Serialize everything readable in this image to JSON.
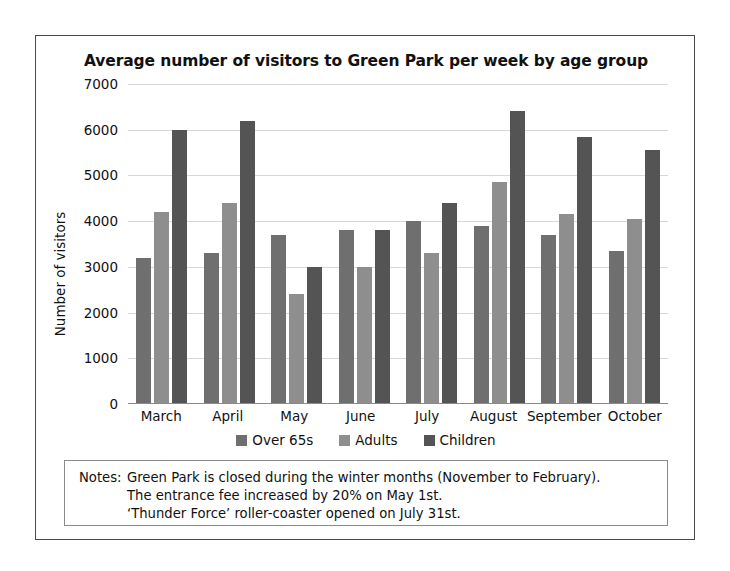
{
  "chart_data": {
    "type": "bar",
    "title": "Average number of visitors to Green Park per week by age group",
    "xlabel": "",
    "ylabel": "Number of visitors",
    "categories": [
      "March",
      "April",
      "May",
      "June",
      "July",
      "August",
      "September",
      "October"
    ],
    "series": [
      {
        "name": "Over 65s",
        "color": "#6f6f6f",
        "values": [
          3200,
          3300,
          3700,
          3800,
          4000,
          3900,
          3700,
          3350
        ]
      },
      {
        "name": "Adults",
        "color": "#8e8e8e",
        "values": [
          4200,
          4400,
          2400,
          3000,
          3300,
          4850,
          4150,
          4050
        ]
      },
      {
        "name": "Children",
        "color": "#545454",
        "values": [
          6000,
          6200,
          3000,
          3800,
          4400,
          6400,
          5850,
          5550
        ]
      }
    ],
    "ylim": [
      0,
      7000
    ],
    "yticks": [
      "0",
      "1000",
      "2000",
      "3000",
      "4000",
      "5000",
      "6000",
      "7000"
    ],
    "ytick_values": [
      0,
      1000,
      2000,
      3000,
      4000,
      5000,
      6000,
      7000
    ],
    "grid": true,
    "legend_position": "bottom"
  },
  "notes": {
    "label": "Notes:",
    "lines": [
      "Green Park is closed during the winter months (November to February).",
      "The entrance fee increased by 20% on May 1st.",
      "‘Thunder Force’ roller-coaster opened on July 31st."
    ]
  }
}
